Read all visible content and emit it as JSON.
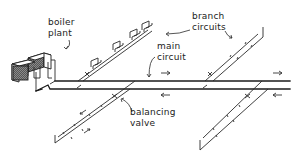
{
  "diagram": {
    "labels": {
      "boiler_plant": [
        "boiler",
        "plant"
      ],
      "branch_circuits": [
        "branch",
        "circuits"
      ],
      "main_circuit": [
        "main",
        "circuit"
      ],
      "balancing_valve": [
        "balancing",
        "valve"
      ]
    },
    "components": [
      {
        "name": "boiler plant",
        "type": "twin boiler units"
      },
      {
        "name": "main circuit",
        "type": "flow and return pipes"
      },
      {
        "name": "branch circuits",
        "count": 4
      },
      {
        "name": "balancing valve",
        "type": "valve on branch circuit"
      },
      {
        "name": "radiators",
        "count": 5,
        "location": "upper-left branch"
      }
    ],
    "flow_arrows": {
      "main_flow": "→",
      "main_return": "←",
      "branch_flow": "↙",
      "branch_return": "↗"
    },
    "colors": {
      "line": "#1a1a1a",
      "hatch": "#555555",
      "background": "#ffffff"
    }
  }
}
